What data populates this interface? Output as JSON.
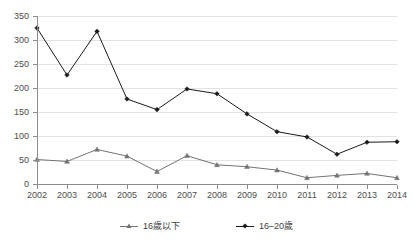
{
  "chart_data": {
    "type": "line",
    "title": "",
    "subtitle": "",
    "xlabel": "",
    "ylabel": "",
    "ylim": [
      0,
      350
    ],
    "ytick_step": 50,
    "yticks": [
      "0",
      "50",
      "100",
      "150",
      "200",
      "250",
      "300",
      "350"
    ],
    "grid": true,
    "legend_position": "bottom",
    "categories": [
      "2002",
      "2003",
      "2004",
      "2005",
      "2006",
      "2007",
      "2008",
      "2009",
      "2010",
      "2011",
      "2012",
      "2013",
      "2014"
    ],
    "series": [
      {
        "name": "16歲以下",
        "color": "#737373",
        "marker": "triangle",
        "values": [
          51,
          47,
          72,
          58,
          26,
          59,
          40,
          36,
          29,
          13,
          18,
          22,
          13
        ]
      },
      {
        "name": "16–20歲",
        "color": "#1a1a1a",
        "marker": "diamond",
        "values": [
          325,
          227,
          318,
          177,
          155,
          198,
          188,
          146,
          109,
          98,
          62,
          87,
          88
        ]
      }
    ]
  },
  "colors": {
    "gridline": "#e2e2e2",
    "axis": "#8c8c8c",
    "tick_text": "#4d4d4d",
    "legend_text": "#3d3d3d",
    "background": "#ffffff"
  },
  "legend": {
    "items": [
      {
        "label": "16歲以下"
      },
      {
        "label": "16–20歲"
      }
    ]
  }
}
